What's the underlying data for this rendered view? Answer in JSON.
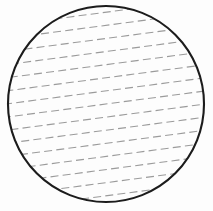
{
  "canvas": {
    "width": 213,
    "height": 211,
    "background_color": "#fdfdfd"
  },
  "chart_data": {
    "type": "diagram",
    "shape": "circle",
    "title": "",
    "xlabel": "",
    "ylabel": "",
    "grid": false,
    "legend": null,
    "circle": {
      "center_x": 106,
      "center_y": 104,
      "radius": 98,
      "stroke_color": "#1c1c1c",
      "stroke_width": 2.1,
      "fill_color": "none"
    },
    "hatching": {
      "style": "dashed",
      "angle_degrees": -7.5,
      "stroke_color": "#9b9b9b",
      "stroke_width": 1.1,
      "dash_length": 8,
      "gap_length": 4.2,
      "vertical_spacing": 13,
      "line_count": 17,
      "line_offsets_y": [
        -104,
        -91,
        -78,
        -65,
        -52,
        -39,
        -26,
        -13,
        0,
        13,
        26,
        39,
        52,
        65,
        78,
        91,
        104
      ]
    }
  }
}
